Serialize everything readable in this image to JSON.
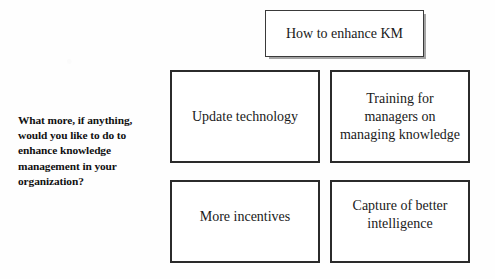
{
  "figure": {
    "question_label": "What more, if anything, would you like to do to enhance knowledge management in your organization?",
    "title_box": {
      "label": "How to enhance KM"
    },
    "option_boxes": [
      {
        "id": "update-technology",
        "label": "Update technology"
      },
      {
        "id": "training-managers",
        "label": "Training for managers on managing knowledge"
      },
      {
        "id": "more-incentives",
        "label": "More incentives"
      },
      {
        "id": "capture-intelligence",
        "label": "Capture of better intelligence"
      }
    ],
    "colors": {
      "background": "#fefefe",
      "box_fill": "#ffffff",
      "box_border": "#2b2b2b",
      "title_border": "#3a3a3a",
      "title_shadow": "#5a5a5a",
      "text": "#1a1a1a",
      "label_text": "#111111"
    }
  }
}
